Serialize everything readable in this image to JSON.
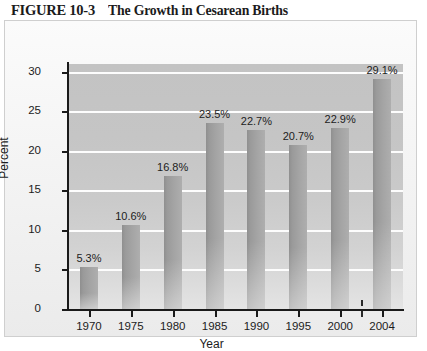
{
  "title": {
    "figure_label": "FIGURE 10-3",
    "caption": "The Growth in Cesarean Births"
  },
  "chart_data": {
    "type": "bar",
    "title": "The Growth in Cesarean Births",
    "xlabel": "Year",
    "ylabel": "Percent",
    "categories": [
      "1970",
      "1975",
      "1980",
      "1985",
      "1990",
      "1995",
      "2000",
      "2004"
    ],
    "values": [
      5.3,
      10.6,
      16.8,
      23.5,
      22.7,
      20.7,
      22.9,
      29.1
    ],
    "data_labels": [
      "5.3%",
      "10.6%",
      "16.8%",
      "23.5%",
      "22.7%",
      "20.7%",
      "22.9%",
      "29.1%"
    ],
    "ylim": [
      0,
      31
    ],
    "yticks": [
      0,
      5,
      10,
      15,
      20,
      25,
      30
    ],
    "ytick_labels": [
      "0",
      "5",
      "10",
      "15",
      "20",
      "25",
      "30"
    ],
    "grid": true,
    "gridlines_at": [
      5,
      10,
      15,
      20,
      25,
      30
    ],
    "legend": null,
    "axis_break": {
      "present": true,
      "between": [
        "2000",
        "2004"
      ]
    },
    "colors": {
      "bar": "#9d9d9d",
      "plot_background": "#cacaca",
      "gridline": "#fdfdfd",
      "axis": "#1a1a1a",
      "text": "#1c1c1c",
      "panel_background": "#f4f4f4"
    }
  }
}
